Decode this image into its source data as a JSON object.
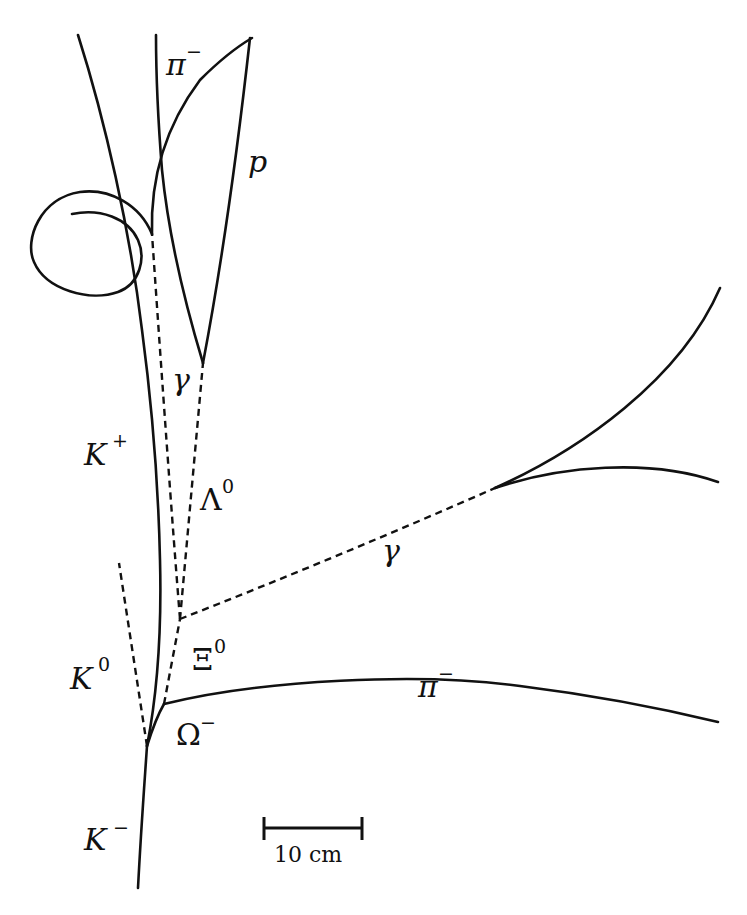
{
  "diagram": {
    "title": "",
    "tracks": [
      {
        "id": "K-minus",
        "label": "K",
        "sup": "−",
        "type": "charged"
      },
      {
        "id": "K-plus",
        "label": "K",
        "sup": "+",
        "type": "charged"
      },
      {
        "id": "K0",
        "label": "K",
        "sup": "0",
        "type": "neutral"
      },
      {
        "id": "Omega-minus",
        "label": "Ω",
        "sup": "−",
        "type": "charged"
      },
      {
        "id": "Xi0",
        "label": "Ξ",
        "sup": "0",
        "type": "neutral"
      },
      {
        "id": "Lambda0",
        "label": "Λ",
        "sup": "0",
        "type": "neutral"
      },
      {
        "id": "gamma-upper",
        "label": "γ",
        "sup": "",
        "type": "neutral"
      },
      {
        "id": "gamma-right",
        "label": "γ",
        "sup": "",
        "type": "neutral"
      },
      {
        "id": "pi-minus-top",
        "label": "π",
        "sup": "−",
        "type": "charged"
      },
      {
        "id": "pi-minus-bottom",
        "label": "π",
        "sup": "−",
        "type": "charged"
      },
      {
        "id": "proton",
        "label": "p",
        "sup": "",
        "type": "charged"
      }
    ],
    "labels": {
      "k_minus": "K",
      "k_minus_sup": "−",
      "k_plus": "K",
      "k_plus_sup": "+",
      "k0": "K",
      "k0_sup": "0",
      "omega": "Ω",
      "omega_sup": "−",
      "xi": "Ξ",
      "xi_sup": "0",
      "lambda": "Λ",
      "lambda_sup": "0",
      "gamma_upper": "γ",
      "gamma_right": "γ",
      "pi_top": "π",
      "pi_top_sup": "−",
      "pi_bottom": "π",
      "pi_bottom_sup": "−",
      "proton": "p"
    },
    "scale_bar": {
      "label": "10 cm"
    },
    "legend": {
      "solid": "charged particle track",
      "dashed": "neutral particle (inferred)"
    }
  }
}
